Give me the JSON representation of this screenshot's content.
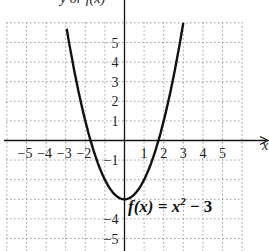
{
  "chart_data": {
    "type": "line",
    "title": "",
    "xlabel": "x",
    "ylabel": "y or f(x)",
    "xlim": [
      -6,
      6.5
    ],
    "ylim": [
      -6,
      6
    ],
    "grid": true,
    "x_ticks": [
      "-5",
      "-4",
      "-3",
      "-2",
      "1",
      "2",
      "3",
      "4",
      "5"
    ],
    "y_ticks": [
      "5",
      "4",
      "3",
      "2",
      "1",
      "-1",
      "-4",
      "-5"
    ],
    "series": [
      {
        "name": "f(x) = x^2 - 3",
        "function": "x^2 - 3",
        "x": [
          -3,
          -2.5,
          -2,
          -1.5,
          -1,
          -0.5,
          0,
          0.5,
          1,
          1.5,
          2,
          2.5,
          3
        ],
        "values": [
          6,
          3.25,
          1,
          -0.75,
          -2,
          -2.75,
          -3,
          -2.75,
          -2,
          -0.75,
          1,
          3.25,
          6
        ]
      }
    ],
    "annotations": [
      {
        "text": "f(x) = x² − 3",
        "x": 0.2,
        "y": -4
      }
    ]
  },
  "labels": {
    "y_axis_title": "y or f(x)",
    "x_axis_title": "x",
    "equation_fx": "f(x) = x",
    "equation_exp": "2",
    "equation_rest": " − 3"
  }
}
